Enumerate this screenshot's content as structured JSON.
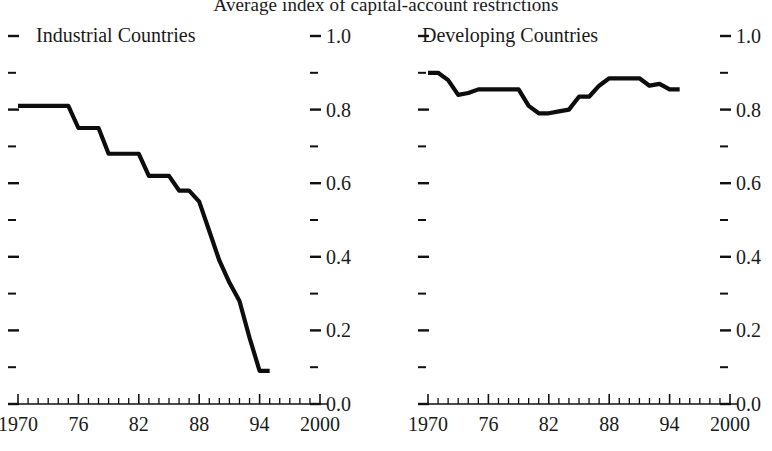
{
  "figure": {
    "title": "Average index of capital-account restrictions"
  },
  "panels": {
    "left": {
      "title": "Industrial Countries"
    },
    "right": {
      "title": "Developing Countries"
    }
  },
  "axis": {
    "y_tick_labels": [
      "1.0",
      "0.8",
      "0.6",
      "0.4",
      "0.2",
      "0.0"
    ],
    "x_tick_labels": [
      "1970",
      "76",
      "82",
      "88",
      "94",
      "2000"
    ]
  },
  "chart_data": [
    {
      "type": "line",
      "title": "Industrial Countries",
      "panel": "left",
      "xlabel": "",
      "ylabel": "",
      "xlim": [
        1970,
        2000
      ],
      "ylim": [
        0.0,
        1.0
      ],
      "xticks": [
        1970,
        1976,
        1982,
        1988,
        1994,
        2000
      ],
      "xtick_labels": [
        "1970",
        "76",
        "82",
        "88",
        "94",
        "2000"
      ],
      "yticks": [
        0.0,
        0.2,
        0.4,
        0.6,
        0.8,
        1.0
      ],
      "ytick_labels": [
        "0.0",
        "0.2",
        "0.4",
        "0.6",
        "0.8",
        "1.0"
      ],
      "yminor_ticks": [
        0.1,
        0.3,
        0.5,
        0.7,
        0.9
      ],
      "grid": false,
      "legend": "none",
      "line_color": "#0d0d0d",
      "x": [
        1970,
        1971,
        1972,
        1973,
        1974,
        1975,
        1976,
        1977,
        1978,
        1979,
        1980,
        1981,
        1982,
        1983,
        1984,
        1985,
        1986,
        1987,
        1988,
        1989,
        1990,
        1991,
        1992,
        1993,
        1994,
        1995
      ],
      "values": [
        0.81,
        0.81,
        0.81,
        0.81,
        0.81,
        0.81,
        0.75,
        0.75,
        0.75,
        0.68,
        0.68,
        0.68,
        0.68,
        0.62,
        0.62,
        0.62,
        0.58,
        0.58,
        0.55,
        0.47,
        0.39,
        0.33,
        0.28,
        0.18,
        0.09,
        0.09
      ]
    },
    {
      "type": "line",
      "title": "Developing Countries",
      "panel": "right",
      "xlabel": "",
      "ylabel": "",
      "xlim": [
        1970,
        2000
      ],
      "ylim": [
        0.0,
        1.0
      ],
      "xticks": [
        1970,
        1976,
        1982,
        1988,
        1994,
        2000
      ],
      "xtick_labels": [
        "1970",
        "76",
        "82",
        "88",
        "94",
        "2000"
      ],
      "yticks": [
        0.0,
        0.2,
        0.4,
        0.6,
        0.8,
        1.0
      ],
      "ytick_labels": [
        "0.0",
        "0.2",
        "0.4",
        "0.6",
        "0.8",
        "1.0"
      ],
      "yminor_ticks": [
        0.1,
        0.3,
        0.5,
        0.7,
        0.9
      ],
      "grid": false,
      "legend": "none",
      "line_color": "#0d0d0d",
      "x": [
        1970,
        1971,
        1972,
        1973,
        1974,
        1975,
        1976,
        1977,
        1978,
        1979,
        1980,
        1981,
        1982,
        1983,
        1984,
        1985,
        1986,
        1987,
        1988,
        1989,
        1990,
        1991,
        1992,
        1993,
        1994,
        1995
      ],
      "values": [
        0.9,
        0.9,
        0.88,
        0.84,
        0.845,
        0.855,
        0.855,
        0.855,
        0.855,
        0.855,
        0.81,
        0.79,
        0.79,
        0.795,
        0.8,
        0.835,
        0.835,
        0.865,
        0.885,
        0.885,
        0.885,
        0.885,
        0.865,
        0.87,
        0.855,
        0.855
      ]
    }
  ]
}
